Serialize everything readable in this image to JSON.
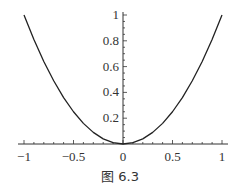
{
  "caption": "图 6.3",
  "chart_data": {
    "type": "line",
    "title": "",
    "xlabel": "",
    "ylabel": "",
    "function": "y = x^2",
    "xlim": [
      -1,
      1
    ],
    "ylim": [
      0,
      1
    ],
    "grid": false,
    "x_ticks": [
      -1,
      -0.5,
      0,
      0.5,
      1
    ],
    "x_tick_labels": [
      "−1",
      "−0.5",
      "0",
      "0.5",
      "1"
    ],
    "y_ticks": [
      0.2,
      0.4,
      0.6,
      0.8,
      1
    ],
    "y_tick_labels": [
      "0.2",
      "0.4",
      "0.6",
      "0.8",
      "1"
    ],
    "series": [
      {
        "name": "x^2",
        "x": [
          -1,
          -0.9,
          -0.8,
          -0.7,
          -0.6,
          -0.5,
          -0.4,
          -0.3,
          -0.2,
          -0.1,
          0,
          0.1,
          0.2,
          0.3,
          0.4,
          0.5,
          0.6,
          0.7,
          0.8,
          0.9,
          1
        ],
        "y": [
          1,
          0.81,
          0.64,
          0.49,
          0.36,
          0.25,
          0.16,
          0.09,
          0.04,
          0.01,
          0,
          0.01,
          0.04,
          0.09,
          0.16,
          0.25,
          0.36,
          0.49,
          0.64,
          0.81,
          1
        ]
      }
    ],
    "colors": {
      "curve": "#222222",
      "axis": "#333333"
    }
  }
}
